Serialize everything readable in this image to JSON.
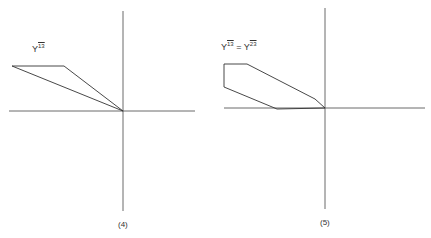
{
  "figures": [
    {
      "id": "4",
      "caption": "(4)",
      "label": {
        "base": "Y",
        "sup": "13"
      },
      "axes": {
        "x": [
          9,
          195
        ],
        "y": [
          11,
          211
        ],
        "origin": [
          123,
          111
        ]
      },
      "polygon": [
        [
          12,
          66
        ],
        [
          64,
          66
        ],
        [
          123,
          111
        ]
      ]
    },
    {
      "id": "5",
      "caption": "(5)",
      "label": {
        "base1": "Y",
        "sup1": "13",
        "eq": " = ",
        "base2": "Y",
        "sup2": "23"
      },
      "axes": {
        "x": [
          224,
          425
        ],
        "y": [
          8,
          209
        ],
        "origin": [
          325,
          108
        ]
      },
      "polygon": [
        [
          224,
          64
        ],
        [
          247,
          64
        ],
        [
          315,
          99
        ],
        [
          325,
          108
        ],
        [
          277,
          109
        ],
        [
          224,
          87
        ]
      ]
    }
  ],
  "colors": {
    "line": "#333333",
    "background": "#ffffff"
  }
}
